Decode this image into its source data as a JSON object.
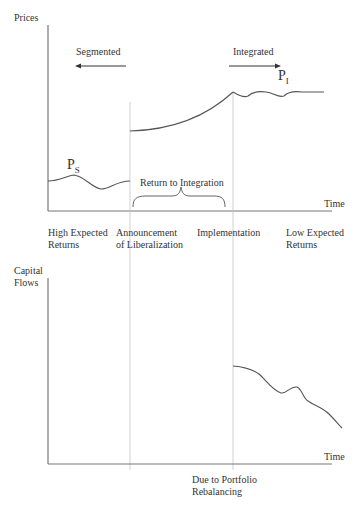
{
  "top_chart": {
    "y_axis_label": "Prices",
    "x_axis_label": "Time",
    "segmented_label": "Segmented",
    "integrated_label": "Integrated",
    "ps_label": "P",
    "ps_sub": "S",
    "pi_label": "P",
    "pi_sub": "I",
    "brace_label": "Return to Integration",
    "x_annotations": [
      {
        "line1": "High Expected",
        "line2": "Returns"
      },
      {
        "line1": "Announcement",
        "line2": "of Liberalization"
      },
      {
        "line1": "Implementation",
        "line2": ""
      },
      {
        "line1": "Low Expected",
        "line2": "Returns"
      }
    ]
  },
  "bottom_chart": {
    "y_axis_label_line1": "Capital",
    "y_axis_label_line2": "Flows",
    "x_axis_label": "Time",
    "annotation_line1": "Due to Portfolio",
    "annotation_line2": "Rebalancing"
  },
  "colors": {
    "line": "#555555",
    "axis": "#777777",
    "guide": "#aaaaaa",
    "text": "#333333"
  }
}
